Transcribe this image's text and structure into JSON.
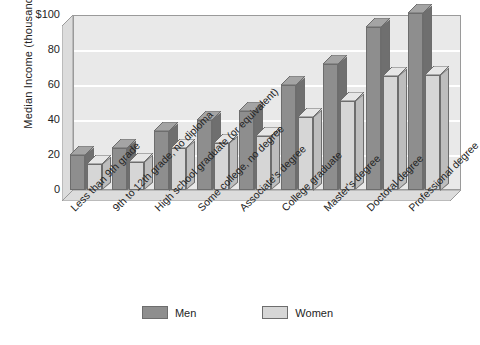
{
  "chart_data": {
    "type": "bar",
    "title": "",
    "xlabel": "",
    "ylabel": "Median Income (thousands)",
    "ylim": [
      0,
      100
    ],
    "yticks": [
      "0",
      "20",
      "40",
      "60",
      "80",
      "$100"
    ],
    "ytick_values": [
      0,
      20,
      40,
      60,
      80,
      100
    ],
    "grid": true,
    "legend_position": "bottom",
    "style": "3d-bar",
    "categories": [
      "Less than 9th grade",
      "9th to 12th grade, no diploma",
      "High school graduate (or equivalent)",
      "Some college, no degree",
      "Associate's degree",
      "College graduate",
      "Master's degree",
      "Doctoral degree",
      "Professional degree"
    ],
    "series": [
      {
        "name": "Men",
        "color": "#8e8e8e",
        "values": [
          20,
          24,
          34,
          40,
          45,
          60,
          72,
          93,
          101
        ]
      },
      {
        "name": "Women",
        "color": "#d6d6d6",
        "values": [
          15,
          16,
          24,
          27,
          31,
          42,
          51,
          65,
          66
        ]
      }
    ]
  },
  "legend": {
    "items": [
      {
        "label": "Men",
        "swatch": "men-swatch"
      },
      {
        "label": "Women",
        "swatch": "women-swatch"
      }
    ]
  },
  "colors": {
    "men_bar": "#8e8e8e",
    "men_bar_side": "#6f6f6f",
    "women_bar": "#d6d6d6",
    "women_bar_side": "#bdbdbd",
    "plot_background": "#e9e9e9",
    "gridline": "#ffffff",
    "axis_line": "#9a9a9a",
    "text": "#242424"
  }
}
